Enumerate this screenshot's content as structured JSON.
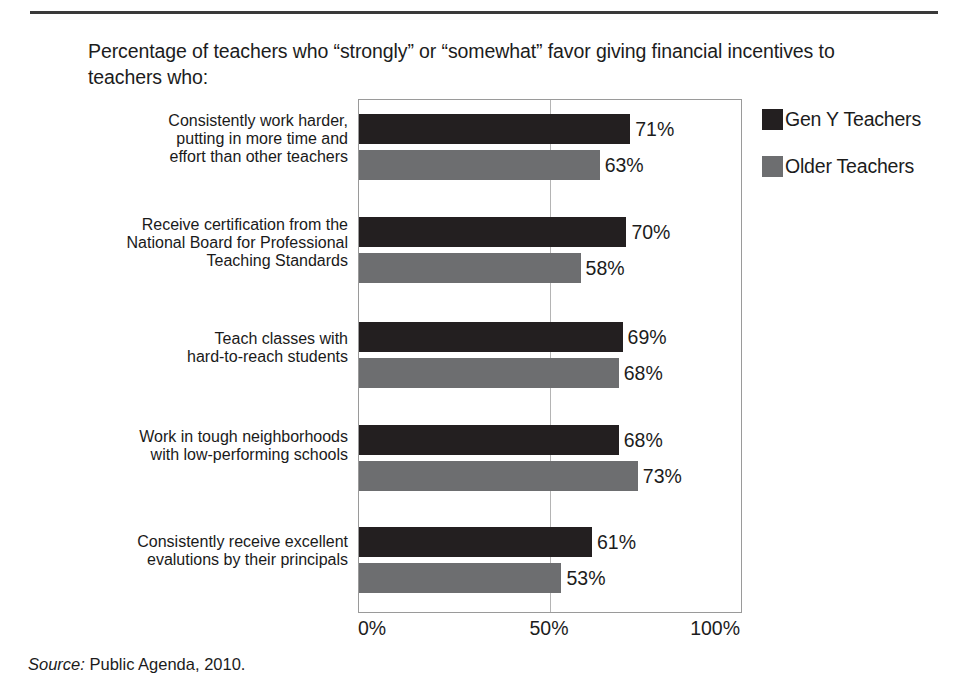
{
  "figure": {
    "title": "Percentage of teachers who “strongly” or “somewhat” favor giving financial incentives to teachers who:",
    "source_lead": "Source:",
    "source_text": " Public Agenda, 2010."
  },
  "legend": {
    "items": [
      {
        "label": "Gen Y Teachers",
        "color": "#231f20",
        "swatch": "legend-swatch-gen-y"
      },
      {
        "label": "Older Teachers",
        "color": "#6d6e70",
        "swatch": "legend-swatch-older"
      }
    ]
  },
  "axis": {
    "ticks": [
      "0%",
      "50%",
      "100%"
    ],
    "tick_values": [
      0,
      50,
      100
    ]
  },
  "categories": [
    {
      "lines": [
        "Consistently work harder,",
        "putting in more time and",
        "effort than other teachers"
      ]
    },
    {
      "lines": [
        "Receive certification from the",
        "National Board for Professional",
        "Teaching Standards"
      ]
    },
    {
      "lines": [
        "Teach classes with",
        "hard-to-reach students"
      ]
    },
    {
      "lines": [
        "Work in tough neighborhoods",
        "with low-performing schools"
      ]
    },
    {
      "lines": [
        "Consistently receive excellent",
        "evalutions by their principals"
      ]
    }
  ],
  "chart_data": {
    "type": "bar",
    "orientation": "horizontal",
    "title": "Percentage of teachers who “strongly” or “somewhat” favor giving financial incentives to teachers who:",
    "xlabel": "",
    "ylabel": "",
    "xlim": [
      0,
      100
    ],
    "xticks": [
      0,
      50,
      100
    ],
    "xticklabels": [
      "0%",
      "50%",
      "100%"
    ],
    "grid": "vertical gridline at 50% only",
    "legend_position": "right-outside-top",
    "categories": [
      "Consistently work harder, putting in more time and effort than other teachers",
      "Receive certification from the National Board for Professional Teaching Standards",
      "Teach classes with hard-to-reach students",
      "Work in tough neighborhoods with low-performing schools",
      "Consistently receive excellent evalutions by their principals"
    ],
    "series": [
      {
        "name": "Gen Y Teachers",
        "color": "#231f20",
        "values": [
          71,
          70,
          69,
          68,
          61
        ],
        "labels": [
          "71%",
          "70%",
          "69%",
          "68%",
          "61%"
        ]
      },
      {
        "name": "Older Teachers",
        "color": "#6d6e70",
        "values": [
          63,
          58,
          68,
          73,
          53
        ],
        "labels": [
          "63%",
          "58%",
          "68%",
          "73%",
          "53%"
        ]
      }
    ]
  }
}
